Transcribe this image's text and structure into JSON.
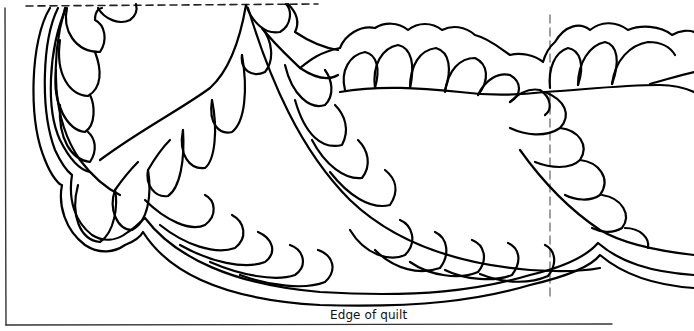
{
  "diagram": {
    "type": "quilting-motif",
    "labels": {
      "edge": "Edge of quilt"
    },
    "guides": {
      "top_dashed_line": {
        "x1": 25,
        "x2": 318,
        "y": 5
      },
      "vertical_dashed_line": {
        "x": 550,
        "y1": 15,
        "y2": 300
      },
      "left_border_line": {
        "x": 5,
        "y1": 8,
        "y2": 325
      },
      "bottom_edge_line": {
        "x1": 5,
        "x2": 612,
        "y": 325
      }
    },
    "colors": {
      "line": "#000000",
      "guide_dashed_vertical": "#888888",
      "background": "#ffffff"
    }
  }
}
